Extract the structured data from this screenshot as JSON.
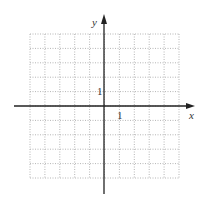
{
  "chart_data": {
    "type": "scatter",
    "title": "",
    "xlabel": "x",
    "ylabel": "y",
    "xlim": [
      -6,
      4
    ],
    "ylim": [
      -5,
      5
    ],
    "grid": true,
    "grid_style": "dotted",
    "tick_labels": {
      "x": "1",
      "y": "1"
    },
    "series": []
  },
  "labels": {
    "x_axis": "x",
    "y_axis": "y",
    "x_tick": "1",
    "y_tick": "1"
  },
  "colors": {
    "axis": "#222222",
    "grid": "#b0b0b0"
  }
}
